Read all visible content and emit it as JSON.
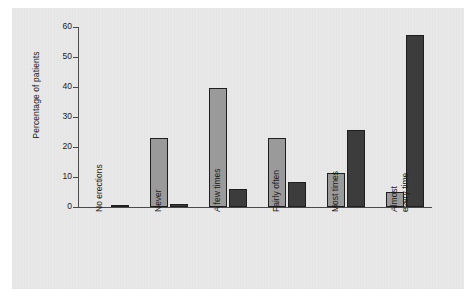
{
  "chart_data": {
    "type": "bar",
    "title": "",
    "subtitle": "",
    "xlabel": "",
    "ylabel": "Percentage of patients",
    "ylim": [
      0,
      60
    ],
    "yticks": [
      0,
      10,
      20,
      30,
      40,
      50,
      60
    ],
    "grid": false,
    "legend": "none",
    "categories": [
      "No erections",
      "Never",
      "A few times",
      "Fairly often",
      "Most times",
      "Almost\never y time"
    ],
    "category_labels": [
      {
        "text": "No erections",
        "lines": [
          "No erections"
        ]
      },
      {
        "text": "Never",
        "lines": [
          "Never"
        ]
      },
      {
        "text": "A few times",
        "lines": [
          "A few times"
        ]
      },
      {
        "text": "Fairly often",
        "lines": [
          "Fairly often"
        ]
      },
      {
        "text": "Most times",
        "lines": [
          "Most times"
        ]
      },
      {
        "text": "Almost every time",
        "lines": [
          "Almost",
          "every time"
        ]
      }
    ],
    "series": [
      {
        "name": "series-light",
        "color": "#9a9a9a",
        "values": [
          0,
          23.1,
          39.8,
          22.9,
          11.5,
          5.0
        ]
      },
      {
        "name": "series-dark",
        "color": "#3c3c3c",
        "values": [
          0.7,
          1.0,
          6.0,
          8.2,
          25.6,
          57.3
        ]
      }
    ]
  },
  "axis": {
    "tick_labels": [
      "0",
      "10",
      "20",
      "30",
      "40",
      "50",
      "60"
    ],
    "y_axis_title": "Percentage of patients"
  },
  "colors": {
    "panel_background": "#e9e9e9",
    "page_background": "#ffffff",
    "axis": "#4a4a4a",
    "text": "#1a1a1a",
    "bar_light": "#9a9a9a",
    "bar_dark": "#3c3c3c",
    "bar_outline": "#1e1e1e"
  }
}
